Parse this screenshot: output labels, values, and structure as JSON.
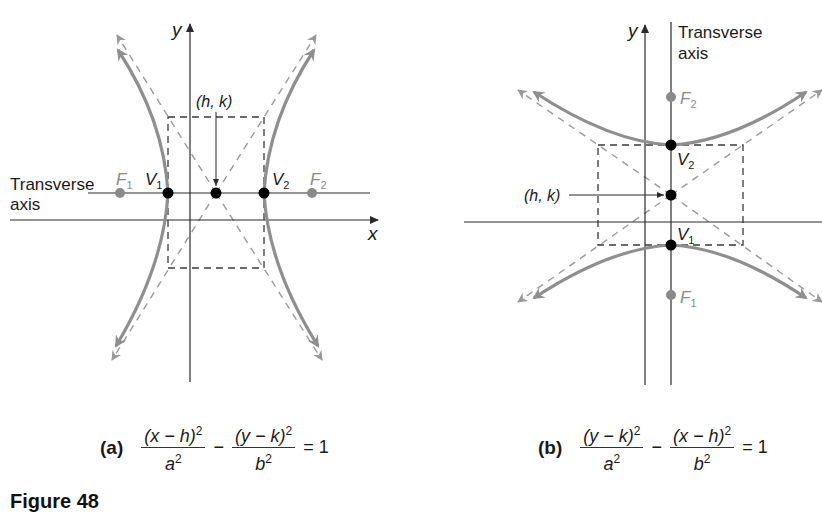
{
  "figure": {
    "caption": "Figure 48",
    "panels": [
      {
        "id": "a",
        "tag": "(a)",
        "orientation": "horizontal transverse axis",
        "axis_labels": {
          "x": "x",
          "y": "y"
        },
        "transverse_axis_label": [
          "Transverse",
          "axis"
        ],
        "center_label": "(h, k)",
        "points": {
          "V1": {
            "label": "V",
            "sub": "1"
          },
          "V2": {
            "label": "V",
            "sub": "2"
          },
          "F1": {
            "label": "F",
            "sub": "1"
          },
          "F2": {
            "label": "F",
            "sub": "2"
          }
        },
        "equation": {
          "term1_num": "(x − h)",
          "term1_den": "a",
          "operator": "−",
          "term2_num": "(y − k)",
          "term2_den": "b",
          "exponent": "2",
          "equals": "= 1"
        }
      },
      {
        "id": "b",
        "tag": "(b)",
        "orientation": "vertical transverse axis",
        "axis_labels": {
          "y": "y"
        },
        "transverse_axis_label": [
          "Transverse",
          "axis"
        ],
        "center_label": "(h, k)",
        "points": {
          "V1": {
            "label": "V",
            "sub": "1"
          },
          "V2": {
            "label": "V",
            "sub": "2"
          },
          "F1": {
            "label": "F",
            "sub": "1"
          },
          "F2": {
            "label": "F",
            "sub": "2"
          }
        },
        "equation": {
          "term1_num": "(y − k)",
          "term1_den": "a",
          "operator": "−",
          "term2_num": "(x − h)",
          "term2_den": "b",
          "exponent": "2",
          "equals": "= 1"
        }
      }
    ],
    "colors": {
      "axis": "#2a2a2a",
      "curve": "#8f8f8f",
      "asymptote": "#9a9a9a",
      "box": "#3a3a3a",
      "vertex": "#000000",
      "focus": "#8a8a8a"
    }
  }
}
